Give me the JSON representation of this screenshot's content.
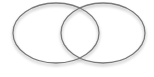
{
  "diagram": {
    "type": "venn",
    "sets": [
      {
        "id": "left",
        "label": "",
        "cx": 56,
        "cy": 33,
        "rx": 43,
        "ry": 30
      },
      {
        "id": "right",
        "label": "",
        "cx": 103,
        "cy": 33,
        "rx": 42,
        "ry": 30
      }
    ],
    "stroke_color": "#7a7a7a",
    "fill_color": "#ffffff",
    "background": "#ffffff"
  }
}
